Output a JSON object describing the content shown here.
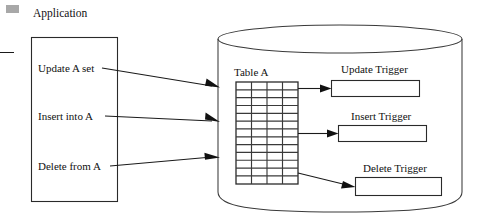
{
  "diagram": {
    "caption_marker": "gray-square-marker",
    "colors": {
      "stroke": "#1a1a1a",
      "background": "#ffffff",
      "marker_gray": "#a8a8a8"
    },
    "application": {
      "label": "Application",
      "statements": [
        {
          "text": "Update A set"
        },
        {
          "text": "Insert into A"
        },
        {
          "text": "Delete from A"
        }
      ]
    },
    "database": {
      "shape": "cylinder",
      "table": {
        "label": "Table A",
        "columns": 4,
        "rows": 13
      },
      "triggers": [
        {
          "label": "Update Trigger",
          "source": "Update A set"
        },
        {
          "label": "Insert Trigger",
          "source": "Insert into A"
        },
        {
          "label": "Delete Trigger",
          "source": "Delete from A"
        }
      ]
    }
  }
}
